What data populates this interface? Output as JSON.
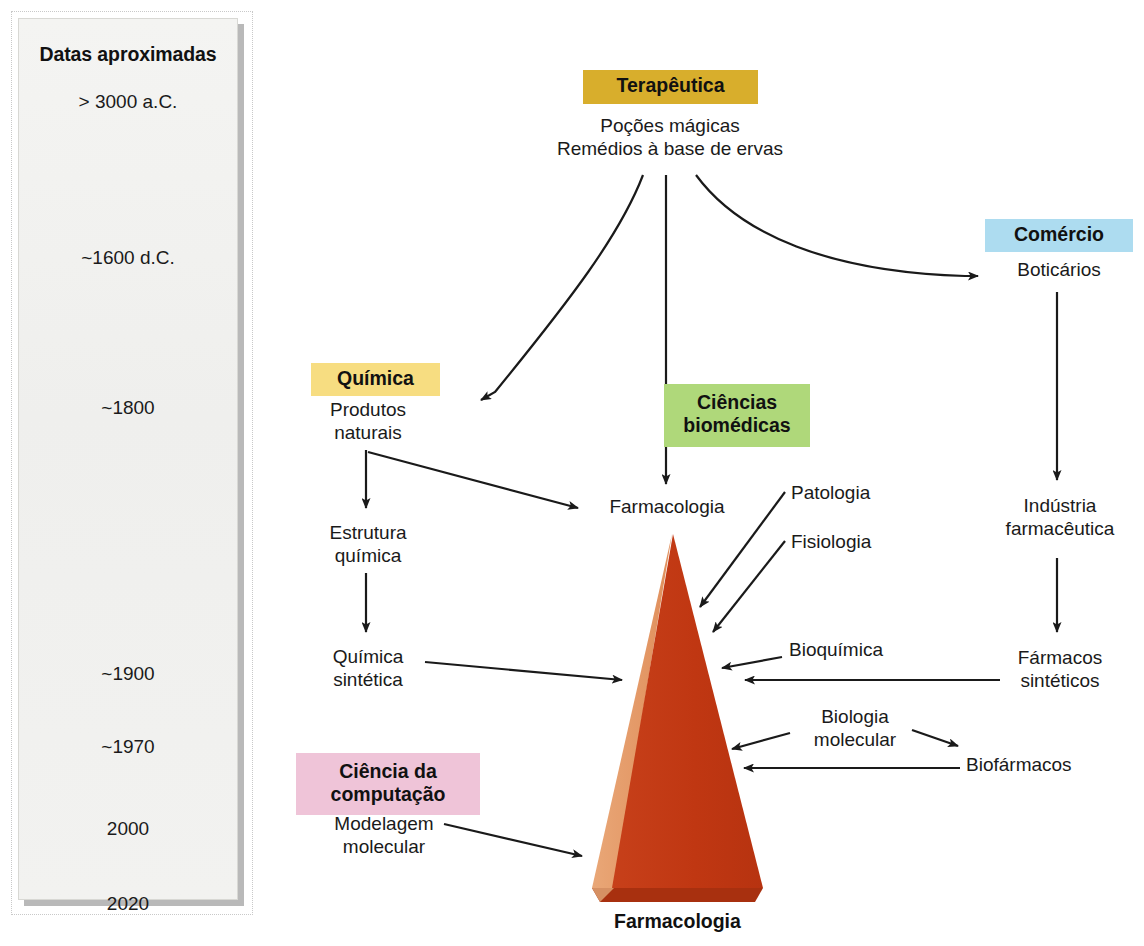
{
  "timeline": {
    "title": "Datas aproximadas",
    "items": [
      {
        "label": "> 3000 a.C.",
        "top": 72
      },
      {
        "label": "~1600 d.C.",
        "top": 228
      },
      {
        "label": "~1800",
        "top": 378
      },
      {
        "label": "~1900",
        "top": 644
      },
      {
        "label": "~1970",
        "top": 717
      },
      {
        "label": "2000",
        "top": 799
      },
      {
        "label": "2020",
        "top": 874
      }
    ]
  },
  "categories": [
    {
      "key": "terapeutica",
      "label": "Terapêutica",
      "color": "#D8AE2C",
      "left": 583,
      "top": 70,
      "width": 175,
      "height": 34
    },
    {
      "key": "comercio",
      "label": "Comércio",
      "color": "#ADDCF0",
      "left": 985,
      "top": 219,
      "width": 148,
      "height": 33
    },
    {
      "key": "quimica",
      "label": "Química",
      "color": "#F7DD81",
      "left": 311,
      "top": 363,
      "width": 129,
      "height": 33
    },
    {
      "key": "ciencias_biomedicas",
      "label": "Ciências\nbiomédicas",
      "color": "#AFD87A",
      "left": 664,
      "top": 384,
      "width": 146,
      "height": 63
    },
    {
      "key": "ciencia_computacao",
      "label": "Ciência da\ncomputação",
      "color": "#EFC4D8",
      "left": 296,
      "top": 753,
      "width": 184,
      "height": 62
    }
  ],
  "nodes": [
    {
      "key": "pocoes-magicas",
      "label": "Poções mágicas\nRemédios à base de ervas",
      "left": 538,
      "top": 114,
      "width": 264
    },
    {
      "key": "boticarios",
      "label": "Boticários",
      "left": 1000,
      "top": 258,
      "width": 118
    },
    {
      "key": "industria-farmaceutica",
      "label": "Indústria\nfarmacêutica",
      "left": 998,
      "top": 494,
      "width": 124
    },
    {
      "key": "farmacos-sinteticos",
      "label": "Fármacos\nsintéticos",
      "left": 1005,
      "top": 646,
      "width": 110
    },
    {
      "key": "produtos-naturais",
      "label": "Produtos\nnaturais",
      "left": 312,
      "top": 398,
      "width": 112
    },
    {
      "key": "estrutura-quimica",
      "label": "Estrutura\nquímica",
      "left": 313,
      "top": 521,
      "width": 110
    },
    {
      "key": "quimica-sintetica",
      "label": "Química\nsintética",
      "left": 313,
      "top": 645,
      "width": 110
    },
    {
      "key": "farmacologia-node",
      "label": "Farmacologia",
      "left": 593,
      "top": 495,
      "width": 148
    },
    {
      "key": "patologia",
      "label": "Patologia",
      "left": 791,
      "top": 481,
      "width": 110
    },
    {
      "key": "fisiologia",
      "label": "Fisiologia",
      "left": 791,
      "top": 530,
      "width": 108
    },
    {
      "key": "bioquimica",
      "label": "Bioquímica",
      "left": 789,
      "top": 638,
      "width": 126
    },
    {
      "key": "biologia-molecular",
      "label": "Biologia\nmolecular",
      "left": 797,
      "top": 705,
      "width": 116
    },
    {
      "key": "biofarmacos",
      "label": "Biofármacos",
      "left": 966,
      "top": 753,
      "width": 142
    },
    {
      "key": "modelagem-molecular",
      "label": "Modelagem\nmolecular",
      "left": 318,
      "top": 812,
      "width": 132
    }
  ],
  "pyramid": {
    "label": "Farmacologia",
    "face_color": "#C23A15",
    "side_color": "#E8A172",
    "base_color": "#A8300F"
  }
}
